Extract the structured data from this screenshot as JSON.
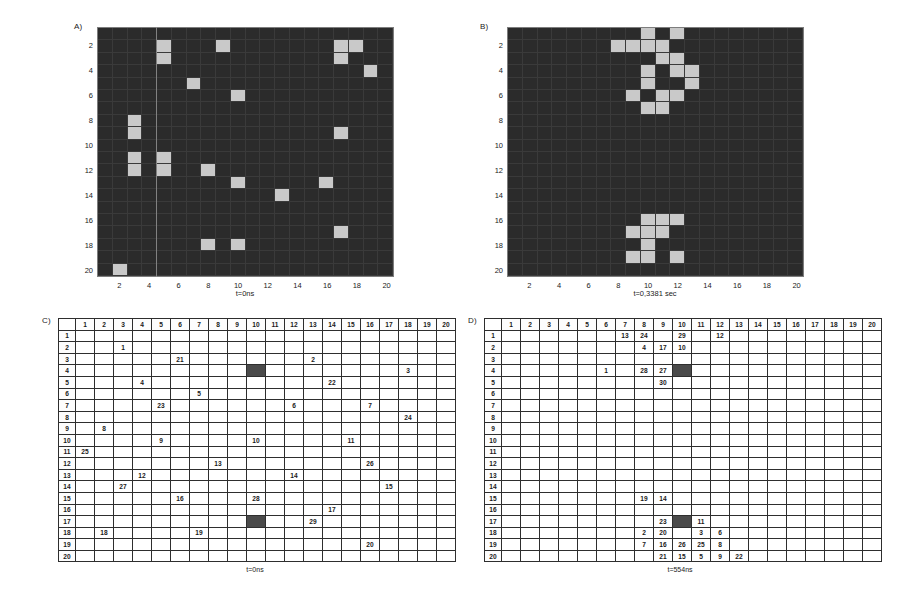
{
  "figure": {
    "panels": [
      {
        "id": "A",
        "letter": "A)",
        "caption": "t=0ns"
      },
      {
        "id": "B",
        "letter": "B)",
        "caption": "t=0,3381 sec"
      },
      {
        "id": "C",
        "letter": "C)",
        "caption": "t=0ns"
      },
      {
        "id": "D",
        "letter": "D)",
        "caption": "t=554ns"
      }
    ]
  },
  "colors": {
    "background_dark": "#2b2b2b",
    "active_cell": "#c9c9c9",
    "highlight_cell": "#4a4a4a",
    "grid_line": "#3a3a3a",
    "text": "#1a1a1a"
  },
  "axis": {
    "ticks": [
      "2",
      "4",
      "6",
      "8",
      "10",
      "12",
      "14",
      "16",
      "18",
      "20"
    ],
    "x_ticks": [
      "2",
      "4",
      "6",
      "8",
      "10",
      "12",
      "14",
      "16",
      "18",
      "20"
    ],
    "y_ticks": [
      "2",
      "4",
      "6",
      "8",
      "10",
      "12",
      "14",
      "16",
      "18",
      "20"
    ]
  },
  "table_headers": {
    "columns": [
      "1",
      "2",
      "3",
      "4",
      "5",
      "6",
      "7",
      "8",
      "9",
      "10",
      "11",
      "12",
      "13",
      "14",
      "15",
      "16",
      "17",
      "18",
      "19",
      "20"
    ],
    "rows": [
      "1",
      "2",
      "3",
      "4",
      "5",
      "6",
      "7",
      "8",
      "9",
      "10",
      "11",
      "12",
      "13",
      "14",
      "15",
      "16",
      "17",
      "18",
      "19",
      "20"
    ]
  },
  "chart_data": [
    {
      "type": "heatmap",
      "panel": "A",
      "title": "A)",
      "xlabel": "t=0ns",
      "ylabel": "",
      "grid": [
        20,
        20
      ],
      "xlim": [
        1,
        20
      ],
      "ylim": [
        1,
        20
      ],
      "legend": "none",
      "active_color": "#c9c9c9",
      "background_color": "#2b2b2b",
      "active_cells": [
        [
          2,
          5
        ],
        [
          3,
          5
        ],
        [
          2,
          9
        ],
        [
          2,
          17
        ],
        [
          2,
          18
        ],
        [
          3,
          17
        ],
        [
          4,
          19
        ],
        [
          5,
          7
        ],
        [
          6,
          10
        ],
        [
          8,
          3
        ],
        [
          9,
          3
        ],
        [
          9,
          17
        ],
        [
          11,
          3
        ],
        [
          12,
          3
        ],
        [
          11,
          5
        ],
        [
          12,
          5
        ],
        [
          12,
          8
        ],
        [
          13,
          10
        ],
        [
          13,
          16
        ],
        [
          14,
          13
        ],
        [
          17,
          17
        ],
        [
          18,
          8
        ],
        [
          18,
          10
        ],
        [
          20,
          2
        ]
      ]
    },
    {
      "type": "heatmap",
      "panel": "B",
      "title": "B)",
      "xlabel": "t=0,3381 sec",
      "ylabel": "",
      "grid": [
        20,
        20
      ],
      "xlim": [
        1,
        20
      ],
      "ylim": [
        1,
        20
      ],
      "legend": "none",
      "active_color": "#c9c9c9",
      "background_color": "#2b2b2b",
      "active_cells": [
        [
          1,
          10
        ],
        [
          1,
          12
        ],
        [
          2,
          8
        ],
        [
          2,
          9
        ],
        [
          2,
          10
        ],
        [
          2,
          11
        ],
        [
          3,
          11
        ],
        [
          3,
          12
        ],
        [
          4,
          10
        ],
        [
          4,
          12
        ],
        [
          4,
          13
        ],
        [
          5,
          10
        ],
        [
          5,
          13
        ],
        [
          6,
          9
        ],
        [
          6,
          11
        ],
        [
          6,
          12
        ],
        [
          7,
          10
        ],
        [
          7,
          11
        ],
        [
          16,
          10
        ],
        [
          16,
          11
        ],
        [
          16,
          12
        ],
        [
          17,
          9
        ],
        [
          17,
          10
        ],
        [
          17,
          11
        ],
        [
          18,
          10
        ],
        [
          19,
          9
        ],
        [
          19,
          10
        ],
        [
          19,
          12
        ]
      ]
    },
    {
      "type": "table",
      "panel": "C",
      "title": "C)",
      "xlabel": "t=0ns",
      "grid": [
        20,
        20
      ],
      "highlight_cells": [
        [
          4,
          10
        ],
        [
          17,
          10
        ]
      ],
      "cells": [
        {
          "row": 2,
          "col": 3,
          "value": "1"
        },
        {
          "row": 3,
          "col": 6,
          "value": "21"
        },
        {
          "row": 3,
          "col": 13,
          "value": "2"
        },
        {
          "row": 4,
          "col": 18,
          "value": "3"
        },
        {
          "row": 5,
          "col": 4,
          "value": "4"
        },
        {
          "row": 5,
          "col": 14,
          "value": "22"
        },
        {
          "row": 6,
          "col": 7,
          "value": "5"
        },
        {
          "row": 7,
          "col": 5,
          "value": "23"
        },
        {
          "row": 7,
          "col": 12,
          "value": "6"
        },
        {
          "row": 7,
          "col": 16,
          "value": "7"
        },
        {
          "row": 8,
          "col": 18,
          "value": "24"
        },
        {
          "row": 9,
          "col": 2,
          "value": "8"
        },
        {
          "row": 10,
          "col": 5,
          "value": "9"
        },
        {
          "row": 10,
          "col": 10,
          "value": "10"
        },
        {
          "row": 10,
          "col": 15,
          "value": "11"
        },
        {
          "row": 11,
          "col": 1,
          "value": "25"
        },
        {
          "row": 12,
          "col": 8,
          "value": "13"
        },
        {
          "row": 12,
          "col": 16,
          "value": "26"
        },
        {
          "row": 13,
          "col": 4,
          "value": "12"
        },
        {
          "row": 13,
          "col": 12,
          "value": "14"
        },
        {
          "row": 14,
          "col": 3,
          "value": "27"
        },
        {
          "row": 14,
          "col": 17,
          "value": "15"
        },
        {
          "row": 15,
          "col": 6,
          "value": "16"
        },
        {
          "row": 15,
          "col": 10,
          "value": "28"
        },
        {
          "row": 16,
          "col": 14,
          "value": "17"
        },
        {
          "row": 17,
          "col": 13,
          "value": "29"
        },
        {
          "row": 18,
          "col": 2,
          "value": "18"
        },
        {
          "row": 18,
          "col": 7,
          "value": "19"
        },
        {
          "row": 19,
          "col": 16,
          "value": "20"
        }
      ]
    },
    {
      "type": "table",
      "panel": "D",
      "title": "D)",
      "xlabel": "t=554ns",
      "grid": [
        20,
        20
      ],
      "highlight_cells": [
        [
          4,
          10
        ],
        [
          17,
          10
        ]
      ],
      "cells": [
        {
          "row": 1,
          "col": 7,
          "value": "13"
        },
        {
          "row": 1,
          "col": 8,
          "value": "24"
        },
        {
          "row": 1,
          "col": 10,
          "value": "29"
        },
        {
          "row": 1,
          "col": 12,
          "value": "12"
        },
        {
          "row": 2,
          "col": 8,
          "value": "4"
        },
        {
          "row": 2,
          "col": 9,
          "value": "17"
        },
        {
          "row": 2,
          "col": 10,
          "value": "10"
        },
        {
          "row": 4,
          "col": 6,
          "value": "1"
        },
        {
          "row": 4,
          "col": 8,
          "value": "28"
        },
        {
          "row": 4,
          "col": 9,
          "value": "27"
        },
        {
          "row": 5,
          "col": 9,
          "value": "30"
        },
        {
          "row": 15,
          "col": 8,
          "value": "19"
        },
        {
          "row": 15,
          "col": 9,
          "value": "14"
        },
        {
          "row": 17,
          "col": 9,
          "value": "23"
        },
        {
          "row": 17,
          "col": 11,
          "value": "11"
        },
        {
          "row": 18,
          "col": 8,
          "value": "2"
        },
        {
          "row": 18,
          "col": 9,
          "value": "20"
        },
        {
          "row": 18,
          "col": 11,
          "value": "3"
        },
        {
          "row": 18,
          "col": 12,
          "value": "6"
        },
        {
          "row": 19,
          "col": 8,
          "value": "7"
        },
        {
          "row": 19,
          "col": 9,
          "value": "16"
        },
        {
          "row": 19,
          "col": 10,
          "value": "26"
        },
        {
          "row": 19,
          "col": 11,
          "value": "25"
        },
        {
          "row": 19,
          "col": 12,
          "value": "8"
        },
        {
          "row": 20,
          "col": 9,
          "value": "21"
        },
        {
          "row": 20,
          "col": 10,
          "value": "15"
        },
        {
          "row": 20,
          "col": 11,
          "value": "5"
        },
        {
          "row": 20,
          "col": 12,
          "value": "9"
        },
        {
          "row": 20,
          "col": 13,
          "value": "22"
        }
      ]
    }
  ]
}
